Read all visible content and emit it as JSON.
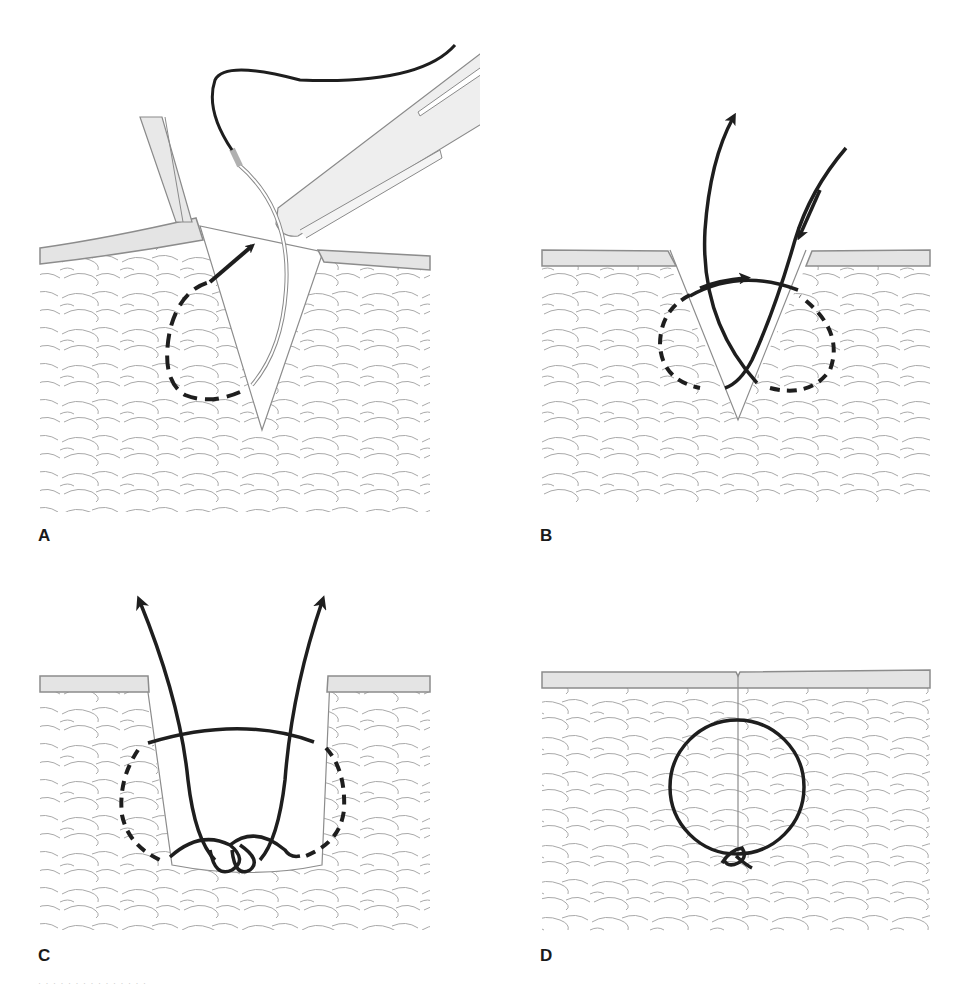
{
  "figure": {
    "type": "surgical technique illustration",
    "colors": {
      "background": "#ffffff",
      "epidermis_fill": "#e4e4e4",
      "epidermis_border": "#8c8c8c",
      "tissue_lines": "#a8a8a8",
      "suture": "#1e1e1e",
      "instrument_fill": "#eeeeee",
      "instrument_outline": "#8a8a8a",
      "needle_swage": "#b0b0b0"
    },
    "panels": [
      {
        "label": "A",
        "description": "Needle held by needle driver; skin edge retracted with forceps; dashed arrow shows needle path entering deep and exiting superficially",
        "elements": [
          "forceps",
          "needle-driver",
          "curved-needle",
          "suture-thread",
          "dashed-path-arrow",
          "v-shaped-wound"
        ]
      },
      {
        "label": "B",
        "description": "Suture passes through both wound edges; arrows show thread direction, dashed circle shows buried loop path",
        "elements": [
          "thread-exit-arrow",
          "thread-entry-arrow",
          "crossing-arrow",
          "dashed-loop",
          "v-shaped-wound"
        ]
      },
      {
        "label": "C",
        "description": "Both suture ends pulled upward; knot tied at the base of the wound",
        "elements": [
          "left-end-arrow",
          "right-end-arrow",
          "horizontal-strand",
          "knot-loops",
          "dashed-loop-left",
          "dashed-loop-right",
          "u-shaped-wound"
        ]
      },
      {
        "label": "D",
        "description": "Wound closed; buried suture loop with knot at the bottom",
        "elements": [
          "closed-incision",
          "circular-suture-loop",
          "buried-knot"
        ]
      }
    ]
  },
  "caption": {
    "text": "· · · · · · · · · · · · · · ·"
  }
}
